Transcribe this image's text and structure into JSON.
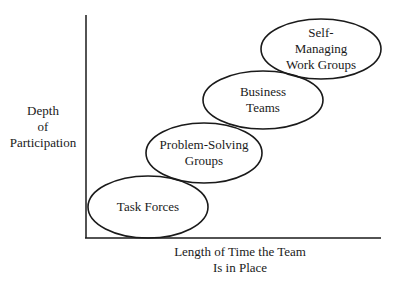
{
  "diagram": {
    "y_axis_label": "Depth\nof\nParticipation",
    "x_axis_label": "Length of Time the Team\nIs in Place",
    "stages": [
      {
        "label": "Task Forces",
        "cx": 148,
        "cy": 207,
        "rx": 60,
        "ry": 31
      },
      {
        "label": "Problem-Solving\nGroups",
        "cx": 204,
        "cy": 153,
        "rx": 58,
        "ry": 30
      },
      {
        "label": "Business\nTeams",
        "cx": 263,
        "cy": 100,
        "rx": 60,
        "ry": 29
      },
      {
        "label": "Self-Managing\nWork Groups",
        "cx": 321,
        "cy": 49,
        "rx": 60,
        "ry": 30
      }
    ],
    "colors": {
      "stroke": "#1a1a1a",
      "background": "#ffffff"
    }
  }
}
